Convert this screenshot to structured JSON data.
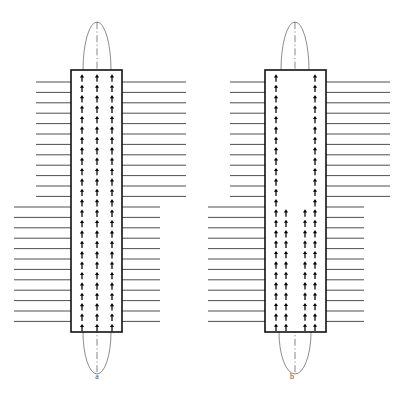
{
  "figure": {
    "background_color": "#ffffff",
    "width": 394,
    "height": 393,
    "colors": {
      "field_line": "#3a3a3a",
      "core_outline": "#111111",
      "core_fill": "#ffffff",
      "dipole": "#000000",
      "envelope": "#6f6f6f",
      "centerline": "#555555",
      "label": "#4a4a4a"
    }
  },
  "panels": [
    {
      "id": "a",
      "label": "a",
      "label_x": 97,
      "label_y": 379,
      "description": "Uniformly magnetized core: three full columns of aligned up dipoles",
      "core": {
        "x": 71,
        "y": 70,
        "width": 51,
        "height": 262
      },
      "centerline": {
        "x": 97,
        "y_top": 22,
        "y_bottom": 374
      },
      "envelope": {
        "top": {
          "cx": 97,
          "cy": 70,
          "rx": 14,
          "ry": 48
        },
        "bottom": {
          "cx": 97,
          "cy": 332,
          "rx": 14,
          "ry": 42
        }
      },
      "dipoles": {
        "direction": "up",
        "columns": [
          82,
          97,
          112
        ],
        "row_start": 78,
        "row_spacing": 10.4,
        "row_count": 25,
        "gap": null
      },
      "field_lines": {
        "left": {
          "x_end": 71,
          "upper": {
            "x_start": 36,
            "y_start": 82,
            "spacing": 10.4,
            "count": 12
          },
          "lower": {
            "x_start": 14,
            "y_start": 207,
            "spacing": 10.4,
            "count": 13
          }
        },
        "right": {
          "x_start": 122,
          "upper": {
            "x_end": 186,
            "y_start": 82,
            "spacing": 10.4,
            "count": 12
          },
          "lower": {
            "x_end": 160,
            "y_start": 207,
            "spacing": 10.4,
            "count": 13
          }
        }
      }
    },
    {
      "id": "b",
      "label": "b",
      "label_x": 292,
      "label_y": 379,
      "description": "Partially magnetized core: hollow centre above the transition, four dipole columns below",
      "core": {
        "x": 265,
        "y": 70,
        "width": 61,
        "height": 262
      },
      "centerline": {
        "x": 295,
        "y_top": 22,
        "y_bottom": 374
      },
      "envelope": {
        "top": {
          "cx": 295,
          "cy": 70,
          "rx": 14,
          "ry": 48
        },
        "bottom": {
          "cx": 295,
          "cy": 332,
          "rx": 16,
          "ry": 42
        }
      },
      "dipoles": {
        "direction": "up",
        "upper": {
          "columns": [
            276,
            315
          ],
          "row_start": 78,
          "row_spacing": 10.4,
          "row_count": 13
        },
        "lower": {
          "columns": [
            276,
            286,
            305,
            315
          ],
          "row_start": 213,
          "row_spacing": 10.4,
          "row_count": 12
        },
        "transition_y": 207
      },
      "field_lines": {
        "left": {
          "x_end": 265,
          "upper": {
            "x_start": 230,
            "y_start": 82,
            "spacing": 10.4,
            "count": 12
          },
          "lower": {
            "x_start": 208,
            "y_start": 207,
            "spacing": 10.4,
            "count": 13
          }
        },
        "right": {
          "x_start": 326,
          "upper": {
            "x_end": 390,
            "y_start": 82,
            "spacing": 10.4,
            "count": 12
          },
          "lower": {
            "x_end": 364,
            "y_start": 207,
            "spacing": 10.4,
            "count": 13
          }
        }
      }
    }
  ]
}
